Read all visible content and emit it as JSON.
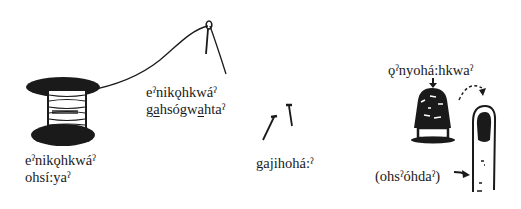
{
  "figure": {
    "items": [
      {
        "id": "spool",
        "object": "spool of thread",
        "line1": "eˀnikǫhkwáˀ",
        "line2": "ohsí:yaˀ"
      },
      {
        "id": "needle",
        "object": "threaded needle",
        "line1": "eˀnikǫhkwáˀ",
        "line2_parts": [
          "g",
          "a",
          "hsógw",
          "a",
          "htaˀ"
        ],
        "line2": "gahsógwahtaˀ"
      },
      {
        "id": "pins",
        "object": "pins",
        "line1": "gajihohá:ˀ"
      },
      {
        "id": "thimble",
        "object": "thimble",
        "line1": "ǫˀnyohá:hkwaˀ"
      },
      {
        "id": "finger",
        "object": "finger",
        "line1": "(ohsˀóhdaˀ)"
      }
    ],
    "colors": {
      "ink": "#1a1a1a",
      "background": "#ffffff"
    }
  }
}
